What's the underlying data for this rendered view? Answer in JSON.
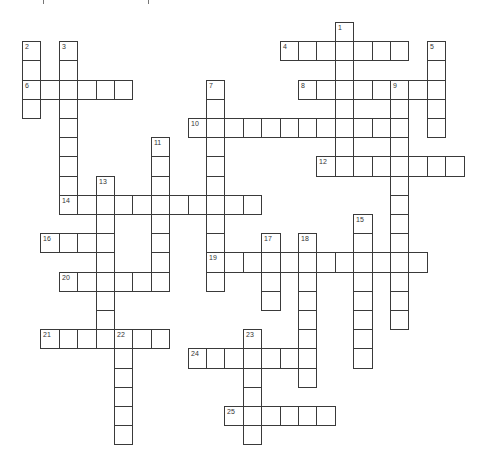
{
  "puzzle": {
    "type": "crossword",
    "grid": {
      "origin_x": 22,
      "origin_y": 22,
      "cell_width": 18.4,
      "cell_height": 19.2,
      "line_color": "#3a3a3a",
      "cell_color": "#ffffff"
    },
    "top_cut_marks_x": [
      43,
      148
    ],
    "entries": [
      {
        "number": "1",
        "direction": "down",
        "col": 17,
        "row": 0,
        "length": 8
      },
      {
        "number": "2",
        "direction": "down",
        "col": 0,
        "row": 1,
        "length": 4
      },
      {
        "number": "3",
        "direction": "down",
        "col": 2,
        "row": 1,
        "length": 9
      },
      {
        "number": "4",
        "direction": "across",
        "col": 14,
        "row": 1,
        "length": 7
      },
      {
        "number": "5",
        "direction": "down",
        "col": 22,
        "row": 1,
        "length": 5
      },
      {
        "number": "6",
        "direction": "across",
        "col": 0,
        "row": 3,
        "length": 6
      },
      {
        "number": "7",
        "direction": "down",
        "col": 10,
        "row": 3,
        "length": 11
      },
      {
        "number": "8",
        "direction": "across",
        "col": 15,
        "row": 3,
        "length": 8
      },
      {
        "number": "9",
        "direction": "down",
        "col": 20,
        "row": 3,
        "length": 13
      },
      {
        "number": "10",
        "direction": "across",
        "col": 9,
        "row": 5,
        "length": 12
      },
      {
        "number": "11",
        "direction": "down",
        "col": 7,
        "row": 6,
        "length": 8
      },
      {
        "number": "12",
        "direction": "across",
        "col": 16,
        "row": 7,
        "length": 8
      },
      {
        "number": "13",
        "direction": "down",
        "col": 4,
        "row": 8,
        "length": 9
      },
      {
        "number": "14",
        "direction": "across",
        "col": 2,
        "row": 9,
        "length": 11
      },
      {
        "number": "15",
        "direction": "down",
        "col": 18,
        "row": 10,
        "length": 8
      },
      {
        "number": "16",
        "direction": "across",
        "col": 1,
        "row": 11,
        "length": 4
      },
      {
        "number": "17",
        "direction": "down",
        "col": 13,
        "row": 11,
        "length": 4
      },
      {
        "number": "18",
        "direction": "down",
        "col": 15,
        "row": 11,
        "length": 8
      },
      {
        "number": "19",
        "direction": "across",
        "col": 10,
        "row": 12,
        "length": 12
      },
      {
        "number": "20",
        "direction": "across",
        "col": 2,
        "row": 13,
        "length": 6
      },
      {
        "number": "21",
        "direction": "across",
        "col": 1,
        "row": 16,
        "length": 7
      },
      {
        "number": "22",
        "direction": "down",
        "col": 5,
        "row": 16,
        "length": 6
      },
      {
        "number": "23",
        "direction": "down",
        "col": 12,
        "row": 16,
        "length": 6
      },
      {
        "number": "24",
        "direction": "across",
        "col": 9,
        "row": 17,
        "length": 7
      },
      {
        "number": "25",
        "direction": "across",
        "col": 11,
        "row": 20,
        "length": 6
      }
    ]
  }
}
